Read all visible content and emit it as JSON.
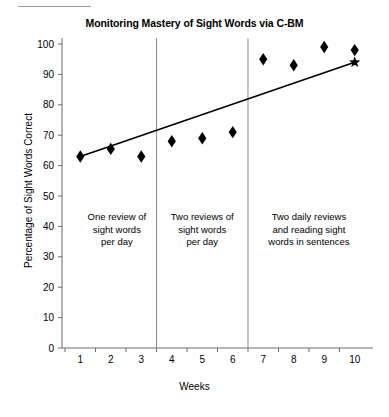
{
  "chart_data": {
    "type": "scatter",
    "title": "Monitoring Mastery of Sight Words via C-BM",
    "xlabel": "Weeks",
    "ylabel": "Percentage of Sight Words Correct",
    "xlim": [
      0.4,
      10.6
    ],
    "ylim": [
      0,
      100
    ],
    "yticks": [
      0,
      10,
      20,
      30,
      40,
      50,
      60,
      70,
      80,
      90,
      100
    ],
    "xticks": [
      1,
      2,
      3,
      4,
      5,
      6,
      7,
      8,
      9,
      10
    ],
    "grid": false,
    "legend": "none",
    "x": [
      1,
      2,
      3,
      4,
      5,
      6,
      7,
      8,
      9,
      10
    ],
    "values": [
      63,
      65.5,
      63,
      68,
      69,
      71,
      95,
      93,
      99,
      98
    ],
    "series": [
      {
        "name": "Percentage of sight words correct",
        "marker": "diamond",
        "values": [
          63,
          65.5,
          63,
          68,
          69,
          71,
          95,
          93,
          99,
          98
        ]
      }
    ],
    "goal_marker": {
      "marker": "star",
      "x": 10,
      "y": 94
    },
    "trend_line": {
      "x": [
        1,
        10
      ],
      "y": [
        63,
        94
      ]
    },
    "phase_lines": [
      3.5,
      6.5
    ],
    "phases": [
      {
        "label_lines": [
          "One review of",
          "sight words",
          "per day"
        ],
        "x_center": 2.2,
        "y_top": 42
      },
      {
        "label_lines": [
          "Two reviews of",
          "sight words",
          "per day"
        ],
        "x_center": 5.0,
        "y_top": 42
      },
      {
        "label_lines": [
          "Two daily reviews",
          "and reading sight",
          "words in sentences"
        ],
        "x_center": 8.5,
        "y_top": 42
      }
    ],
    "colors": {
      "axis": "#6b6b6b",
      "marker": "#000000",
      "trend": "#000000",
      "phase_line": "#8c8c8c",
      "text": "#000000",
      "background": "#ffffff"
    }
  }
}
